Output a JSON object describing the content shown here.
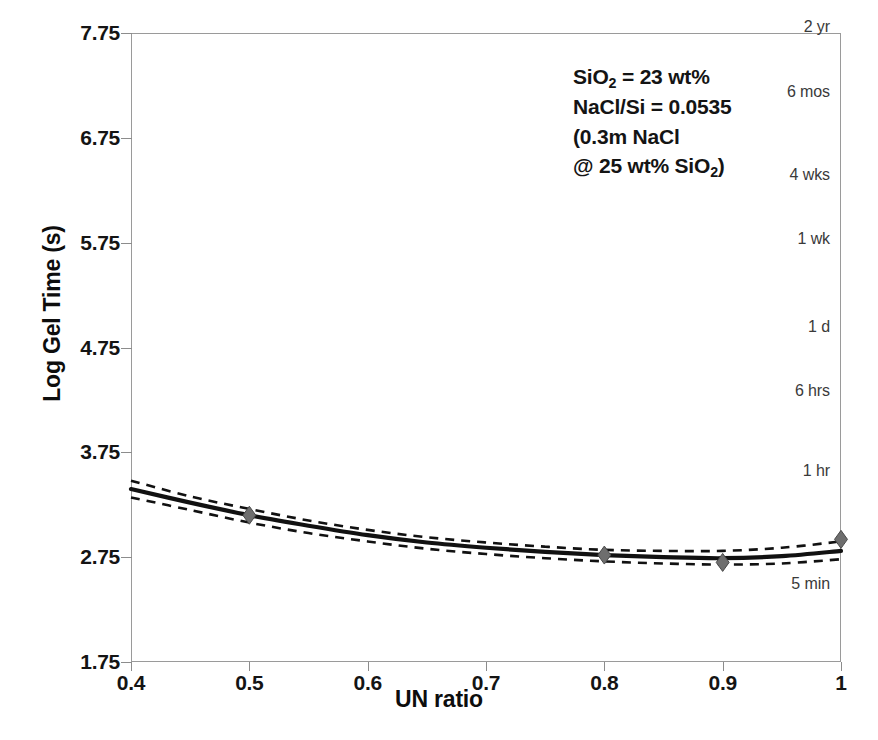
{
  "chart_data": {
    "type": "line",
    "title": "",
    "xlabel": "UN ratio",
    "ylabel": "Log Gel Time (s)",
    "xlim": [
      0.4,
      1.0
    ],
    "ylim": [
      1.75,
      7.75
    ],
    "grid": false,
    "legend_position": "none",
    "x_ticks": [
      "0.4",
      "0.5",
      "0.6",
      "0.7",
      "0.8",
      "0.9",
      "1"
    ],
    "x_tick_values": [
      0.4,
      0.5,
      0.6,
      0.7,
      0.8,
      0.9,
      1.0
    ],
    "y_ticks": [
      "1.75",
      "2.75",
      "3.75",
      "4.75",
      "5.75",
      "6.75",
      "7.75"
    ],
    "y_tick_values": [
      1.75,
      2.75,
      3.75,
      4.75,
      5.75,
      6.75,
      7.75
    ],
    "series": [
      {
        "name": "fitted model",
        "style": "solid",
        "color": "#111111",
        "x": [
          0.4,
          0.45,
          0.5,
          0.55,
          0.6,
          0.65,
          0.7,
          0.75,
          0.8,
          0.85,
          0.9,
          0.95,
          1.0
        ],
        "values": [
          3.4,
          3.27,
          3.15,
          3.05,
          2.96,
          2.89,
          2.84,
          2.8,
          2.77,
          2.75,
          2.74,
          2.76,
          2.81
        ]
      },
      {
        "name": "upper confidence band",
        "style": "dashed",
        "color": "#111111",
        "x": [
          0.4,
          0.45,
          0.5,
          0.55,
          0.6,
          0.65,
          0.7,
          0.75,
          0.8,
          0.85,
          0.9,
          0.95,
          1.0
        ],
        "values": [
          3.48,
          3.33,
          3.21,
          3.1,
          3.01,
          2.94,
          2.89,
          2.85,
          2.82,
          2.81,
          2.81,
          2.84,
          2.9
        ]
      },
      {
        "name": "lower confidence band",
        "style": "dashed",
        "color": "#111111",
        "x": [
          0.4,
          0.45,
          0.5,
          0.55,
          0.6,
          0.65,
          0.7,
          0.75,
          0.8,
          0.85,
          0.9,
          0.95,
          1.0
        ],
        "values": [
          3.32,
          3.2,
          3.08,
          2.98,
          2.9,
          2.83,
          2.78,
          2.74,
          2.71,
          2.69,
          2.68,
          2.69,
          2.73
        ]
      }
    ],
    "markers": {
      "name": "measured data points",
      "shape": "diamond",
      "color": "#6e6e6e",
      "x": [
        0.5,
        0.8,
        0.9,
        1.0
      ],
      "values": [
        3.15,
        2.77,
        2.7,
        2.92
      ]
    },
    "annotations": [
      {
        "name": "composition-note",
        "lines": [
          "SiO2 = 23 wt%",
          "NaCl/Si = 0.0535",
          "(0.3m NaCl",
          "@ 25 wt% SiO2)"
        ]
      }
    ],
    "secondary_axis": {
      "name": "gel-time-scale",
      "position": "right-inside",
      "labels": [
        "2 yr",
        "6 mos",
        "4 wks",
        "1 wk",
        "1 d",
        "6 hrs",
        "1 hr",
        "5 min"
      ],
      "log_seconds": [
        7.8,
        7.18,
        6.39,
        5.78,
        4.94,
        4.33,
        3.56,
        2.48
      ]
    }
  },
  "axis": {
    "y_title": "Log Gel Time (s)",
    "x_title": "UN ratio"
  },
  "annotation": {
    "line1_a": "SiO",
    "line1_sub": "2",
    "line1_b": " = 23 wt%",
    "line2": "NaCl/Si = 0.0535",
    "line3": "(0.3m NaCl",
    "line4_a": "@ 25 wt% SiO",
    "line4_sub": "2",
    "line4_b": ")"
  }
}
